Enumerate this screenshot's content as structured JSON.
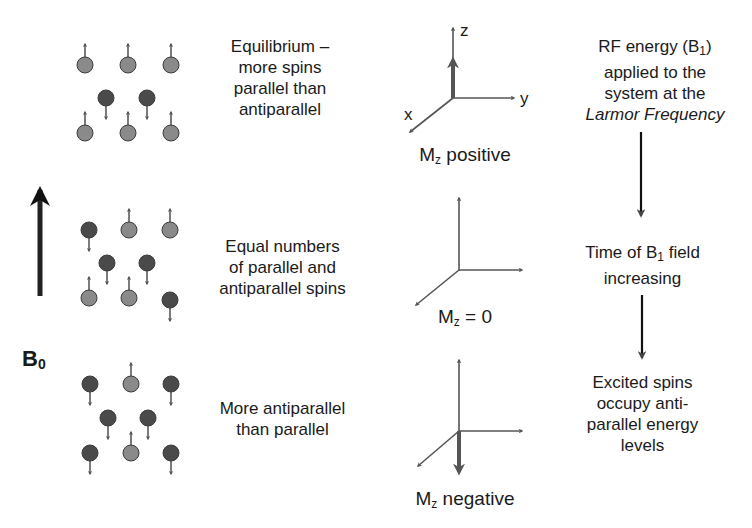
{
  "colors": {
    "parallel_spin": "#8a8a8a",
    "antiparallel_spin": "#4a4a4a",
    "spin_stroke": "#3c3c3c",
    "arrow": "#333333",
    "text": "#1a1a1a"
  },
  "field": {
    "label_main": "B",
    "label_sub": "0"
  },
  "rows": [
    {
      "description": [
        "Equilibrium –",
        "more spins",
        "parallel than",
        "antiparallel"
      ],
      "spins": [
        {
          "x": 85,
          "y": 65,
          "dir": "up"
        },
        {
          "x": 128,
          "y": 65,
          "dir": "up"
        },
        {
          "x": 171,
          "y": 65,
          "dir": "up"
        },
        {
          "x": 106,
          "y": 98,
          "dir": "down"
        },
        {
          "x": 147,
          "y": 98,
          "dir": "down"
        },
        {
          "x": 85,
          "y": 133,
          "dir": "up"
        },
        {
          "x": 128,
          "y": 133,
          "dir": "up"
        },
        {
          "x": 171,
          "y": 133,
          "dir": "up"
        }
      ],
      "axes_label_main": "M",
      "axes_label_sub": "z",
      "axes_label_rest": " positive",
      "magnetization": "positive"
    },
    {
      "description": [
        "Equal numbers",
        "of parallel and",
        "antiparallel spins"
      ],
      "spins": [
        {
          "x": 89,
          "y": 230,
          "dir": "down"
        },
        {
          "x": 129,
          "y": 230,
          "dir": "up"
        },
        {
          "x": 170,
          "y": 230,
          "dir": "up"
        },
        {
          "x": 107,
          "y": 263,
          "dir": "down"
        },
        {
          "x": 147,
          "y": 263,
          "dir": "down"
        },
        {
          "x": 89,
          "y": 298,
          "dir": "up"
        },
        {
          "x": 129,
          "y": 298,
          "dir": "up"
        },
        {
          "x": 170,
          "y": 300,
          "dir": "down"
        }
      ],
      "axes_label_main": "M",
      "axes_label_sub": "z",
      "axes_label_rest": " = 0",
      "magnetization": "zero"
    },
    {
      "description": [
        "More antiparallel",
        "than parallel"
      ],
      "spins": [
        {
          "x": 90,
          "y": 384,
          "dir": "down"
        },
        {
          "x": 131,
          "y": 384,
          "dir": "up"
        },
        {
          "x": 171,
          "y": 384,
          "dir": "down"
        },
        {
          "x": 108,
          "y": 418,
          "dir": "down"
        },
        {
          "x": 148,
          "y": 418,
          "dir": "down"
        },
        {
          "x": 90,
          "y": 453,
          "dir": "down"
        },
        {
          "x": 131,
          "y": 453,
          "dir": "up"
        },
        {
          "x": 171,
          "y": 453,
          "dir": "down"
        }
      ],
      "axes_label_main": "M",
      "axes_label_sub": "z",
      "axes_label_rest": " negative",
      "magnetization": "negative"
    }
  ],
  "axes_letters": {
    "z": "z",
    "y": "y",
    "x": "x"
  },
  "process": {
    "step1": {
      "line1_a": "RF energy  (B",
      "line1_sub": "1",
      "line1_b": ")",
      "line2": "applied to the",
      "line3": "system at the",
      "line4": "Larmor Frequency"
    },
    "step2": {
      "line1_a": "Time of B",
      "line1_sub": "1",
      "line1_b": " field",
      "line2": "increasing"
    },
    "step3": {
      "line1": "Excited spins",
      "line2": "occupy anti-",
      "line3": "parallel energy",
      "line4": "levels"
    }
  }
}
